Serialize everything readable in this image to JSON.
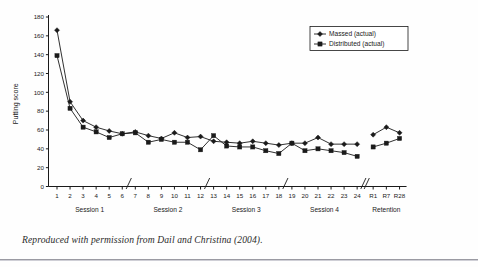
{
  "caption": "Reproduced with permission from Dail and Christina (2004).",
  "legend": {
    "position": "top-right",
    "entries": [
      {
        "label": "Massed (actual)",
        "marker": "diamond-marker-icon"
      },
      {
        "label": "Distributed (actual)",
        "marker": "square-marker-icon"
      }
    ]
  },
  "axis": {
    "y_label": "Putting score",
    "y_ticks": [
      0,
      20,
      40,
      60,
      80,
      100,
      120,
      140,
      160,
      180
    ],
    "x_group_labels": [
      "Session 1",
      "Session 2",
      "Session 3",
      "Session 4",
      "Retention"
    ]
  },
  "chart_data": {
    "type": "line",
    "title": "",
    "xlabel": "",
    "ylabel": "Putting score",
    "ylim": [
      0,
      180
    ],
    "ytick_step": 20,
    "grid": false,
    "legend_position": "top-right",
    "categories": [
      "1",
      "2",
      "3",
      "4",
      "5",
      "6",
      "7",
      "8",
      "9",
      "10",
      "11",
      "12",
      "13",
      "14",
      "15",
      "16",
      "17",
      "18",
      "19",
      "20",
      "21",
      "22",
      "23",
      "24",
      "R1",
      "R7",
      "R28"
    ],
    "axis_breaks_after": [
      "6",
      "12",
      "18",
      "24"
    ],
    "series": [
      {
        "name": "Massed (actual)",
        "marker": "diamond",
        "values": [
          166,
          90,
          70,
          63,
          59,
          56,
          58,
          54,
          51,
          57,
          52,
          53,
          48,
          47,
          46,
          48,
          46,
          44,
          46,
          46,
          52,
          45,
          45,
          45,
          55,
          63,
          57
        ]
      },
      {
        "name": "Distributed (actual)",
        "marker": "square",
        "values": [
          139,
          83,
          63,
          58,
          52,
          56,
          57,
          47,
          50,
          47,
          47,
          39,
          54,
          43,
          42,
          42,
          38,
          35,
          46,
          38,
          40,
          38,
          36,
          32,
          42,
          46,
          51
        ]
      }
    ]
  }
}
